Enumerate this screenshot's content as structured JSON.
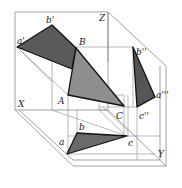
{
  "diagram": {
    "title": "",
    "colors": {
      "background": "#ffffff",
      "frame_line": "#8a8a8a",
      "projection_line": "#9a9a9a",
      "edge": "#111111",
      "v_projection_fill": "#5a5a5a",
      "space_triangle_fill": "#8e8e8e",
      "w_projection_fill": "#555555",
      "h_projection_fill": "#6a6a6a"
    },
    "axes": {
      "x": "X",
      "y": "Y",
      "z": "Z"
    },
    "points": {
      "space": {
        "A": "A",
        "B": "B",
        "C": "C"
      },
      "front_view": {
        "a": "a'",
        "b": "b'"
      },
      "side_view": {
        "b": "b''",
        "a": "a'''",
        "c": "c''"
      },
      "top_view": {
        "a": "a",
        "b": "b",
        "c": "c"
      }
    },
    "shapes": [
      {
        "name": "front-projection",
        "vertices": [
          "a'",
          "b'",
          "B"
        ]
      },
      {
        "name": "space-triangle",
        "vertices": [
          "A",
          "B",
          "C"
        ]
      },
      {
        "name": "side-projection",
        "vertices": [
          "b''",
          "a'''",
          "c''"
        ]
      },
      {
        "name": "top-projection",
        "vertices": [
          "a",
          "b",
          "c"
        ]
      }
    ]
  }
}
